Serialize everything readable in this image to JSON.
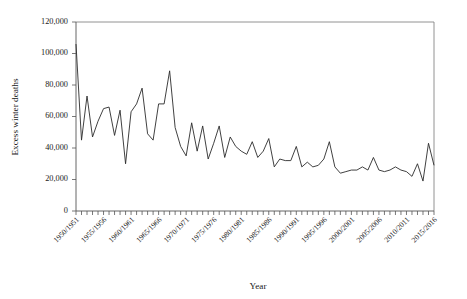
{
  "chart_data": {
    "type": "line",
    "title": "",
    "xlabel": "Year",
    "ylabel": "Excess winter deaths",
    "ylim": [
      0,
      120000
    ],
    "ytick_labels": [
      "0",
      "20,000",
      "40,000",
      "60,000",
      "80,000",
      "100,000",
      "120,000"
    ],
    "ytick_values": [
      0,
      20000,
      40000,
      60000,
      80000,
      100000,
      120000
    ],
    "grid": false,
    "legend": null,
    "legend_position": "none",
    "x_tick_count": 66,
    "xtick_labels": [
      "1950/1951",
      "1955/1956",
      "1960/1961",
      "1965/1966",
      "1970/1971",
      "1975/1976",
      "1980/1981",
      "1985/1986",
      "1990/1991",
      "1995/1996",
      "2000/2001",
      "2005/2006",
      "2010/2011",
      "2015/2016"
    ],
    "xtick_label_indices": [
      0,
      5,
      10,
      15,
      20,
      25,
      30,
      35,
      40,
      45,
      50,
      55,
      60,
      65
    ],
    "categories": [
      "1950/1951",
      "1951/1952",
      "1952/1953",
      "1953/1954",
      "1954/1955",
      "1955/1956",
      "1956/1957",
      "1957/1958",
      "1958/1959",
      "1959/1960",
      "1960/1961",
      "1961/1962",
      "1962/1963",
      "1963/1964",
      "1964/1965",
      "1965/1966",
      "1966/1967",
      "1967/1968",
      "1968/1969",
      "1969/1970",
      "1970/1971",
      "1971/1972",
      "1972/1973",
      "1973/1974",
      "1974/1975",
      "1975/1976",
      "1976/1977",
      "1977/1978",
      "1978/1979",
      "1979/1980",
      "1980/1981",
      "1981/1982",
      "1982/1983",
      "1983/1984",
      "1984/1985",
      "1985/1986",
      "1986/1987",
      "1987/1988",
      "1988/1989",
      "1989/1990",
      "1990/1991",
      "1991/1992",
      "1992/1993",
      "1993/1994",
      "1994/1995",
      "1995/1996",
      "1996/1997",
      "1997/1998",
      "1998/1999",
      "1999/2000",
      "2000/2001",
      "2001/2002",
      "2002/2003",
      "2003/2004",
      "2004/2005",
      "2005/2006",
      "2006/2007",
      "2007/2008",
      "2008/2009",
      "2009/2010",
      "2010/2011",
      "2011/2012",
      "2012/2013",
      "2013/2014",
      "2014/2015",
      "2015/2016"
    ],
    "series": [
      {
        "name": "Excess winter deaths",
        "color": "#2b2b2b",
        "values": [
          106000,
          45000,
          73000,
          47000,
          57000,
          65000,
          66000,
          48000,
          64000,
          30000,
          63000,
          68000,
          78000,
          49000,
          45000,
          68000,
          68000,
          89000,
          53000,
          41000,
          35000,
          56000,
          38000,
          54000,
          33000,
          43000,
          54000,
          34000,
          47000,
          41000,
          38000,
          36000,
          44000,
          34000,
          38000,
          46000,
          28000,
          33000,
          32000,
          32000,
          41000,
          28000,
          31000,
          28000,
          29000,
          33000,
          44000,
          28000,
          24000,
          25000,
          26000,
          26000,
          28000,
          26000,
          34000,
          26000,
          25000,
          26000,
          28000,
          26000,
          25000,
          22000,
          30000,
          19000,
          43000,
          29000
        ]
      }
    ]
  }
}
